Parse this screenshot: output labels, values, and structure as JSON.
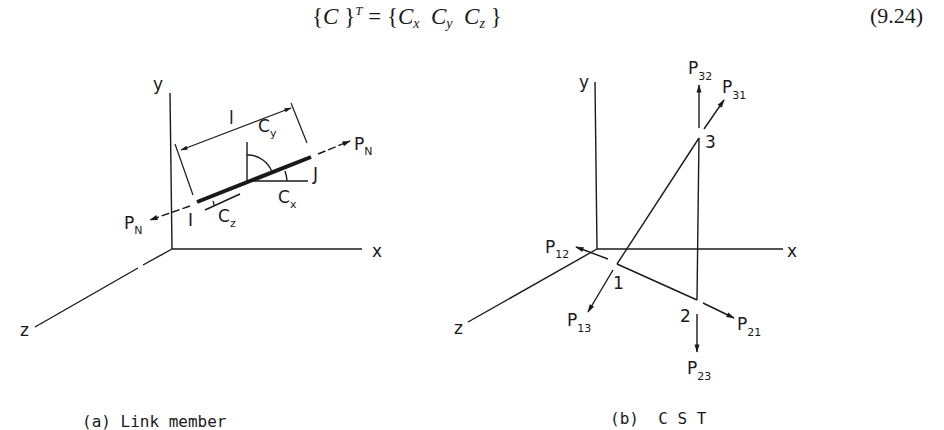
{
  "equation": {
    "lhs_open": "{",
    "lhs_var": "C",
    "lhs_close": "}",
    "lhs_sup": "T",
    "equals": "=",
    "rhs_open": "{",
    "rhs_terms": [
      {
        "base": "C",
        "sub": "x"
      },
      {
        "base": "C",
        "sub": "y"
      },
      {
        "base": "C",
        "sub": "z"
      }
    ],
    "rhs_close": "}",
    "number": "(9.24)"
  },
  "panel_a": {
    "caption": "(a) Link member",
    "axes": {
      "x": "x",
      "y": "y",
      "z": "z"
    },
    "length_label": "l",
    "node_i": "I",
    "node_j": "J",
    "force_right": {
      "base": "P",
      "sub": "N"
    },
    "force_left": {
      "base": "P",
      "sub": "N"
    },
    "direction_cosines": [
      {
        "base": "C",
        "sub": "x"
      },
      {
        "base": "C",
        "sub": "y"
      },
      {
        "base": "C",
        "sub": "z"
      }
    ]
  },
  "panel_b": {
    "caption": "(b)  C S T",
    "axes": {
      "x": "x",
      "y": "y",
      "z": "z"
    },
    "nodes": [
      "1",
      "2",
      "3"
    ],
    "forces": [
      {
        "base": "P",
        "sub": "32"
      },
      {
        "base": "P",
        "sub": "31"
      },
      {
        "base": "P",
        "sub": "12"
      },
      {
        "base": "P",
        "sub": "13"
      },
      {
        "base": "P",
        "sub": "21"
      },
      {
        "base": "P",
        "sub": "23"
      }
    ]
  },
  "colors": {
    "ink": "#1a1a1a",
    "background": "#ffffff"
  }
}
